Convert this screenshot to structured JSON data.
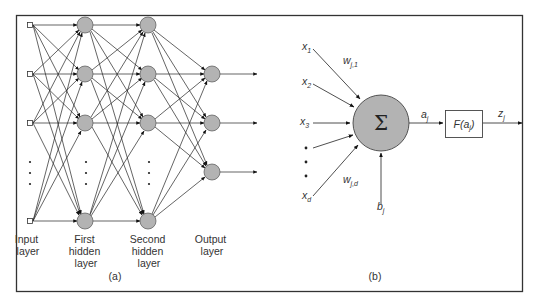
{
  "figure": {
    "panel_a": {
      "caption": "(a)",
      "layers": [
        {
          "name": "Input layer",
          "lines": [
            "Input",
            "layer"
          ]
        },
        {
          "name": "First hidden layer",
          "lines": [
            "First",
            "hidden",
            "layer"
          ]
        },
        {
          "name": "Second hidden layer",
          "lines": [
            "Second",
            "hidden",
            "layer"
          ]
        },
        {
          "name": "Output layer",
          "lines": [
            "Output",
            "layer"
          ]
        }
      ],
      "ellipsis": "⋮"
    },
    "panel_b": {
      "caption": "(b)",
      "inputs": [
        "x1",
        "x2",
        "x3",
        "xd"
      ],
      "weights": {
        "first": "w",
        "first_sub": "j,1",
        "last": "w",
        "last_sub": "j,d"
      },
      "sum_symbol": "Σ",
      "activation": {
        "a": "a",
        "a_sub": "j"
      },
      "function_box": {
        "prefix": "F(a",
        "sub": "j",
        "suffix": ")"
      },
      "output": {
        "z": "z",
        "z_sub": "j"
      },
      "bias": {
        "b": "b",
        "b_sub": "j"
      },
      "input_labels": [
        {
          "base": "x",
          "sub": "1"
        },
        {
          "base": "x",
          "sub": "2"
        },
        {
          "base": "x",
          "sub": "3"
        },
        {
          "base": "x",
          "sub": "d"
        }
      ]
    },
    "colors": {
      "node_fill": "#b3b3b3",
      "stroke": "#222222",
      "border": "#333333"
    }
  }
}
